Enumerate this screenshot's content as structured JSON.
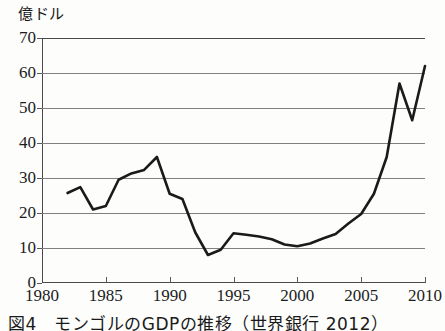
{
  "figure": {
    "y_unit_label": "億ドル",
    "caption": "図4　モンゴルのGDPの推移（世界銀行 2012）"
  },
  "chart_data": {
    "type": "line",
    "title": "",
    "subtitle": "",
    "xlabel": "",
    "ylabel": "億ドル",
    "xlim": [
      1980,
      2010
    ],
    "ylim": [
      0,
      70
    ],
    "grid": true,
    "legend": "none",
    "xticks": [
      1980,
      1985,
      1990,
      1995,
      2000,
      2005,
      2010
    ],
    "xtick_labels": [
      "1980",
      "1985",
      "1990",
      "1995",
      "2000",
      "2005",
      "2010"
    ],
    "yticks": [
      0,
      10,
      20,
      30,
      40,
      50,
      60,
      70
    ],
    "ytick_labels": [
      "0",
      "10",
      "20",
      "30",
      "40",
      "50",
      "60",
      "70"
    ],
    "line_color": "#1a1a1a",
    "line_width": 2.6,
    "series": [
      {
        "name": "GDP",
        "x": [
          1982,
          1983,
          1984,
          1985,
          1986,
          1987,
          1988,
          1989,
          1990,
          1991,
          1992,
          1993,
          1994,
          1995,
          1996,
          1997,
          1998,
          1999,
          2000,
          2001,
          2002,
          2003,
          2004,
          2005,
          2006,
          2007,
          2008,
          2009,
          2010
        ],
        "values": [
          25.7,
          27.4,
          21.0,
          22.0,
          29.5,
          31.3,
          32.3,
          36.0,
          25.5,
          24.0,
          14.5,
          8.0,
          9.5,
          14.2,
          13.8,
          13.3,
          12.5,
          11.0,
          10.5,
          11.3,
          12.7,
          14.0,
          17.0,
          19.7,
          25.5,
          36.0,
          57.0,
          46.5,
          62.0
        ]
      }
    ]
  }
}
